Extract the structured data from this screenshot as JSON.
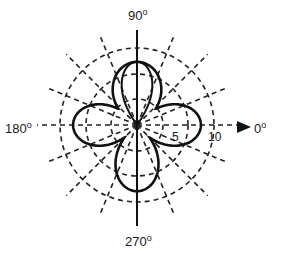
{
  "diagram": {
    "type": "polar-radiation-pattern",
    "center": {
      "x": 137,
      "y": 125
    },
    "scale_px_per_unit": 7.7,
    "ring_values": [
      2.5,
      5,
      10
    ],
    "ring_labels": [
      {
        "text": "5",
        "value": 5
      },
      {
        "text": "10",
        "value": 10
      }
    ],
    "spoke_angle_step_deg": 22.5,
    "axis_labels": {
      "right": {
        "text": "0",
        "deg": "o"
      },
      "top": {
        "text": "90",
        "deg": "o"
      },
      "left": {
        "text": "180",
        "deg": "o"
      },
      "bottom": {
        "text": "270",
        "deg": "o"
      }
    },
    "arrow": {
      "direction": "0deg",
      "shape": "filled-triangle"
    },
    "curves": [
      {
        "name": "outer-four-leaf-pattern",
        "style": "solid-thick",
        "lobes": [
          {
            "direction_deg": 0,
            "max": 8.3
          },
          {
            "direction_deg": 90,
            "max": 8.2
          },
          {
            "direction_deg": 180,
            "max": 8.3
          },
          {
            "direction_deg": 270,
            "max": 8.6
          }
        ]
      },
      {
        "name": "inner-narrow-lobe-90",
        "style": "solid-thin",
        "lobes": [
          {
            "direction_deg": 90,
            "max": 8.2
          }
        ]
      }
    ],
    "colors": {
      "line": "#111111",
      "background": "#ffffff"
    }
  }
}
